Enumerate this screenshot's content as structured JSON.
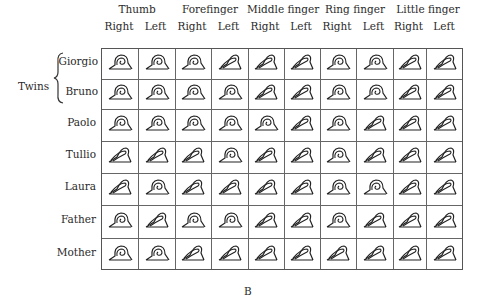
{
  "figure": {
    "label": "B",
    "fingers": [
      "Thumb",
      "Forefinger",
      "Middle finger",
      "Ring finger",
      "Little finger"
    ],
    "hands": [
      "Right",
      "Left",
      "Right",
      "Left",
      "Right",
      "Left",
      "Right",
      "Left",
      "Right",
      "Left"
    ],
    "group_label": "Twins",
    "rows": [
      {
        "name": "Giorgio",
        "patterns": [
          "whorl",
          "whorl",
          "whorl",
          "loop",
          "loop",
          "loop",
          "whorl",
          "whorl",
          "loop",
          "loop"
        ]
      },
      {
        "name": "Bruno",
        "patterns": [
          "whorl",
          "whorl",
          "whorl",
          "whorl",
          "loop",
          "loop",
          "whorl",
          "whorl",
          "loop",
          "loop"
        ]
      },
      {
        "name": "Paolo",
        "patterns": [
          "whorl",
          "whorl",
          "whorl",
          "whorl",
          "whorl",
          "loop",
          "whorl",
          "loop",
          "loop",
          "loop"
        ]
      },
      {
        "name": "Tullio",
        "patterns": [
          "loop",
          "loop",
          "loop",
          "whorl",
          "loop",
          "loop",
          "whorl",
          "loop",
          "loop",
          "loop"
        ]
      },
      {
        "name": "Laura",
        "patterns": [
          "loop",
          "whorl",
          "loop",
          "loop",
          "loop",
          "loop",
          "whorl",
          "whorl",
          "loop",
          "loop"
        ]
      },
      {
        "name": "Father",
        "patterns": [
          "whorl",
          "loop",
          "whorl",
          "whorl",
          "loop",
          "loop",
          "whorl",
          "loop",
          "loop",
          "loop"
        ]
      },
      {
        "name": "Mother",
        "patterns": [
          "whorl",
          "whorl",
          "loop",
          "loop",
          "loop",
          "loop",
          "loop",
          "loop",
          "loop",
          "loop"
        ]
      }
    ]
  }
}
